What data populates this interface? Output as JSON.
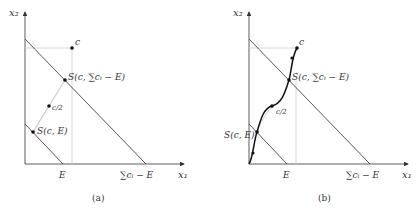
{
  "panels": [
    {
      "id": "a",
      "caption": "(a)",
      "axes": {
        "x_label": "x₁",
        "y_label": "x₂"
      },
      "tick_labels": {
        "E": "E",
        "sum": "∑cᵢ − E"
      },
      "points": {
        "c": "c",
        "S_sum": "S(c, ∑cᵢ − E)",
        "half": "c/2",
        "S_E": "S(c, E)"
      }
    },
    {
      "id": "b",
      "caption": "(b)",
      "axes": {
        "x_label": "x₁",
        "y_label": "x₂"
      },
      "tick_labels": {
        "E": "E",
        "sum": "∑cᵢ − E"
      },
      "points": {
        "c": "c",
        "S_sum": "S(c, ∑cᵢ − E)",
        "half": "c/2",
        "S_E": "S(c, E)"
      }
    }
  ],
  "colors": {
    "axis": "#333333",
    "line": "#444444",
    "guide": "#cccccc",
    "curve": "#111111"
  }
}
